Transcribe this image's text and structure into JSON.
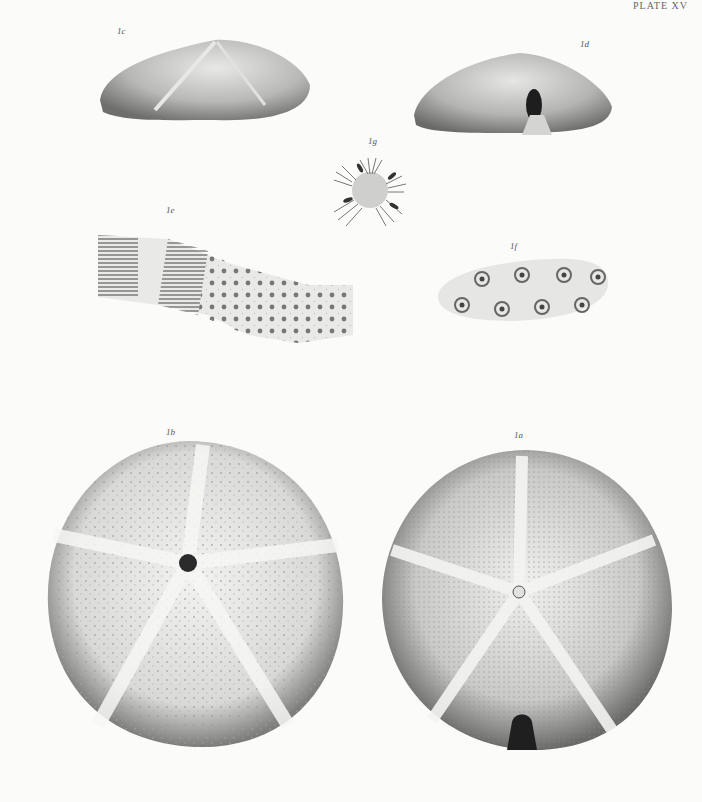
{
  "plate": {
    "header": "PLATE XV",
    "description": "Lithographic plate of a fossil echinoid (sand-dollar type), shown in several views with enlarged details",
    "colors": {
      "paper": "#fbfbfa",
      "ink": "#2e2e2e",
      "shade": "#8a8a8a",
      "light": "#d8d8d8"
    }
  },
  "figures": [
    {
      "id": "1c",
      "label": "1c",
      "view": "lateral view (side profile)"
    },
    {
      "id": "1d",
      "label": "1d",
      "view": "posterior view showing periproct"
    },
    {
      "id": "1g",
      "label": "1g",
      "view": "apical disc enlarged"
    },
    {
      "id": "1e",
      "label": "1e",
      "view": "ambulacral plates enlarged"
    },
    {
      "id": "1f",
      "label": "1f",
      "view": "tubercles enlarged"
    },
    {
      "id": "1b",
      "label": "1b",
      "view": "oral (lower) surface"
    },
    {
      "id": "1a",
      "label": "1a",
      "view": "aboral (upper) surface with petals"
    }
  ]
}
